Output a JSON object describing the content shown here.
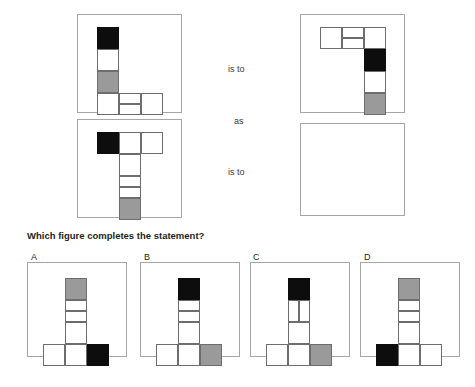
{
  "prompt": "Which figure completes the statement?",
  "connectors": [
    {
      "text": "is to",
      "x": 228,
      "y": 64
    },
    {
      "text": "as",
      "x": 234,
      "y": 116
    },
    {
      "text": "is to",
      "x": 228,
      "y": 167
    }
  ],
  "colors": {
    "black": "#0d0d0d",
    "gray": "#9a9a9a",
    "white": "#ffffff",
    "cell_border": "#6d6d6d",
    "panel_border": "#a6a6a6",
    "text": "#231f20"
  },
  "cell_size": 22,
  "panels": [
    {
      "name": "stimulus-1",
      "x": 77,
      "y": 14,
      "w": 105,
      "h": 99
    },
    {
      "name": "stimulus-2",
      "x": 77,
      "y": 119,
      "w": 105,
      "h": 99
    },
    {
      "name": "stimulus-3",
      "x": 300,
      "y": 14,
      "w": 105,
      "h": 99
    },
    {
      "name": "answer-slot",
      "x": 300,
      "y": 123,
      "w": 105,
      "h": 93
    }
  ],
  "figures": {
    "stimulus_1": {
      "description": "L-shape: vertical column black/white/gray over a bottom row extending right, middle bottom cell split horizontally",
      "cells": [
        {
          "x": 0,
          "y": 0,
          "w": 22,
          "h": 22,
          "fill": "black"
        },
        {
          "x": 0,
          "y": 22,
          "w": 22,
          "h": 22,
          "fill": "white"
        },
        {
          "x": 0,
          "y": 44,
          "w": 22,
          "h": 22,
          "fill": "gray"
        },
        {
          "x": 0,
          "y": 66,
          "w": 22,
          "h": 22,
          "fill": "white"
        },
        {
          "x": 22,
          "y": 66,
          "w": 22,
          "h": 11,
          "fill": "white"
        },
        {
          "x": 22,
          "y": 77,
          "w": 22,
          "h": 11,
          "fill": "white"
        },
        {
          "x": 44,
          "y": 66,
          "w": 22,
          "h": 22,
          "fill": "white"
        }
      ]
    },
    "stimulus_2": {
      "description": "T-shape: crossbar with black at left, stem of four cells ending gray",
      "cells": [
        {
          "x": 0,
          "y": 0,
          "w": 22,
          "h": 22,
          "fill": "black"
        },
        {
          "x": 22,
          "y": 0,
          "w": 22,
          "h": 22,
          "fill": "white"
        },
        {
          "x": 44,
          "y": 0,
          "w": 22,
          "h": 22,
          "fill": "white"
        },
        {
          "x": 22,
          "y": 22,
          "w": 22,
          "h": 22,
          "fill": "white"
        },
        {
          "x": 22,
          "y": 44,
          "w": 22,
          "h": 11,
          "fill": "white"
        },
        {
          "x": 22,
          "y": 55,
          "w": 22,
          "h": 11,
          "fill": "white"
        },
        {
          "x": 22,
          "y": 66,
          "w": 22,
          "h": 22,
          "fill": "gray"
        }
      ]
    },
    "stimulus_3": {
      "description": "Stimulus 1 rotated 180 degrees: top horizontal arm with split middle cell, column descends black/white/gray",
      "cells": [
        {
          "x": 0,
          "y": 0,
          "w": 22,
          "h": 22,
          "fill": "white"
        },
        {
          "x": 22,
          "y": 0,
          "w": 22,
          "h": 11,
          "fill": "white"
        },
        {
          "x": 22,
          "y": 11,
          "w": 22,
          "h": 11,
          "fill": "white"
        },
        {
          "x": 44,
          "y": 0,
          "w": 22,
          "h": 22,
          "fill": "white"
        },
        {
          "x": 44,
          "y": 22,
          "w": 22,
          "h": 22,
          "fill": "black"
        },
        {
          "x": 44,
          "y": 44,
          "w": 22,
          "h": 22,
          "fill": "white"
        },
        {
          "x": 44,
          "y": 66,
          "w": 22,
          "h": 22,
          "fill": "gray"
        }
      ]
    }
  },
  "options": [
    {
      "label": "A",
      "label_x": 31,
      "label_y": 252,
      "panel": {
        "x": 27,
        "y": 262,
        "w": 100,
        "h": 95
      },
      "figure_offset": {
        "x": 15,
        "y": 15
      },
      "cells": [
        {
          "x": 22,
          "y": 0,
          "w": 22,
          "h": 22,
          "fill": "gray"
        },
        {
          "x": 22,
          "y": 22,
          "w": 22,
          "h": 11,
          "fill": "white"
        },
        {
          "x": 22,
          "y": 33,
          "w": 22,
          "h": 11,
          "fill": "white"
        },
        {
          "x": 22,
          "y": 44,
          "w": 22,
          "h": 22,
          "fill": "white"
        },
        {
          "x": 0,
          "y": 66,
          "w": 22,
          "h": 22,
          "fill": "white"
        },
        {
          "x": 22,
          "y": 66,
          "w": 22,
          "h": 22,
          "fill": "white"
        },
        {
          "x": 44,
          "y": 66,
          "w": 22,
          "h": 22,
          "fill": "black"
        }
      ]
    },
    {
      "label": "B",
      "label_x": 144,
      "label_y": 252,
      "panel": {
        "x": 140,
        "y": 262,
        "w": 100,
        "h": 95
      },
      "figure_offset": {
        "x": 15,
        "y": 15
      },
      "cells": [
        {
          "x": 22,
          "y": 0,
          "w": 22,
          "h": 22,
          "fill": "black"
        },
        {
          "x": 22,
          "y": 22,
          "w": 22,
          "h": 11,
          "fill": "white"
        },
        {
          "x": 22,
          "y": 33,
          "w": 22,
          "h": 11,
          "fill": "white"
        },
        {
          "x": 22,
          "y": 44,
          "w": 22,
          "h": 22,
          "fill": "white"
        },
        {
          "x": 0,
          "y": 66,
          "w": 22,
          "h": 22,
          "fill": "white"
        },
        {
          "x": 22,
          "y": 66,
          "w": 22,
          "h": 22,
          "fill": "white"
        },
        {
          "x": 44,
          "y": 66,
          "w": 22,
          "h": 22,
          "fill": "gray"
        }
      ]
    },
    {
      "label": "C",
      "label_x": 253,
      "label_y": 252,
      "panel": {
        "x": 250,
        "y": 262,
        "w": 100,
        "h": 95
      },
      "figure_offset": {
        "x": 15,
        "y": 15
      },
      "cells": [
        {
          "x": 22,
          "y": 0,
          "w": 22,
          "h": 22,
          "fill": "black"
        },
        {
          "x": 22,
          "y": 22,
          "w": 11,
          "h": 22,
          "fill": "white"
        },
        {
          "x": 33,
          "y": 22,
          "w": 11,
          "h": 22,
          "fill": "white"
        },
        {
          "x": 22,
          "y": 44,
          "w": 22,
          "h": 22,
          "fill": "white"
        },
        {
          "x": 0,
          "y": 66,
          "w": 22,
          "h": 22,
          "fill": "white"
        },
        {
          "x": 22,
          "y": 66,
          "w": 22,
          "h": 22,
          "fill": "white"
        },
        {
          "x": 44,
          "y": 66,
          "w": 22,
          "h": 22,
          "fill": "gray"
        }
      ]
    },
    {
      "label": "D",
      "label_x": 364,
      "label_y": 252,
      "panel": {
        "x": 360,
        "y": 262,
        "w": 100,
        "h": 95
      },
      "figure_offset": {
        "x": 15,
        "y": 15
      },
      "cells": [
        {
          "x": 22,
          "y": 0,
          "w": 22,
          "h": 22,
          "fill": "gray"
        },
        {
          "x": 22,
          "y": 22,
          "w": 22,
          "h": 11,
          "fill": "white"
        },
        {
          "x": 22,
          "y": 33,
          "w": 22,
          "h": 11,
          "fill": "white"
        },
        {
          "x": 22,
          "y": 44,
          "w": 22,
          "h": 22,
          "fill": "white"
        },
        {
          "x": 0,
          "y": 66,
          "w": 22,
          "h": 22,
          "fill": "black"
        },
        {
          "x": 22,
          "y": 66,
          "w": 22,
          "h": 22,
          "fill": "white"
        },
        {
          "x": 44,
          "y": 66,
          "w": 22,
          "h": 22,
          "fill": "white"
        }
      ]
    }
  ]
}
